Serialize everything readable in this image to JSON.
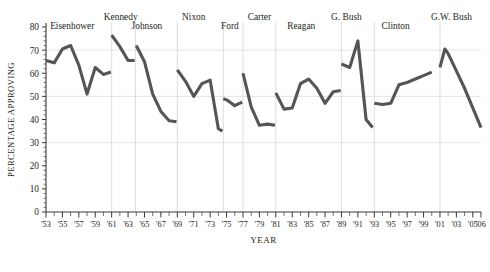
{
  "chart_data": {
    "type": "line",
    "title": "",
    "xlabel": "YEAR",
    "ylabel": "PERCENTAGE APPROVING",
    "ylim": [
      0,
      80
    ],
    "ytick_values": [
      0,
      10,
      20,
      30,
      40,
      50,
      60,
      70,
      80
    ],
    "ytick_labels": [
      "0",
      "10",
      "20",
      "30",
      "40",
      "50",
      "60",
      "70",
      "80"
    ],
    "xlim": [
      1953,
      2006
    ],
    "xtick_labels": [
      "'53",
      "'55",
      "'57",
      "'59",
      "'61",
      "'63",
      "'65",
      "'67",
      "'69",
      "'71",
      "'73",
      "'75",
      "'77",
      "'79",
      "'81",
      "'83",
      "'85",
      "'87",
      "'89",
      "'91",
      "'93",
      "'95",
      "'97",
      "'99",
      "'01",
      "'03",
      "'05",
      "'06"
    ],
    "xtick_years": [
      1953,
      1955,
      1957,
      1959,
      1961,
      1963,
      1965,
      1967,
      1969,
      1971,
      1973,
      1975,
      1977,
      1979,
      1981,
      1983,
      1985,
      1987,
      1989,
      1991,
      1993,
      1995,
      1997,
      1999,
      2001,
      2003,
      2005,
      2006
    ],
    "minor_tick_years": [
      1954,
      1956,
      1958,
      1960,
      1962,
      1964,
      1966,
      1968,
      1970,
      1972,
      1974,
      1976,
      1978,
      1980,
      1982,
      1984,
      1986,
      1988,
      1990,
      1992,
      1994,
      1996,
      1998,
      2000,
      2002,
      2004
    ],
    "grid": "horizontal-at-30-50-70",
    "gridline_values": [
      30,
      50,
      70
    ],
    "legend": "none",
    "line_color": "#555457",
    "annotations": [
      {
        "label": "Eisenhower",
        "x": 1956.2,
        "y_px": 21
      },
      {
        "label": "Kennedy",
        "x": 1962.1,
        "y_px": 12
      },
      {
        "label": "Johnson",
        "x": 1965.3,
        "y_px": 21
      },
      {
        "label": "Nixon",
        "x": 1971.0,
        "y_px": 12
      },
      {
        "label": "Ford",
        "x": 1975.4,
        "y_px": 21
      },
      {
        "label": "Carter",
        "x": 1979.0,
        "y_px": 12
      },
      {
        "label": "Reagan",
        "x": 1984.1,
        "y_px": 21
      },
      {
        "label": "G. Bush",
        "x": 1989.6,
        "y_px": 12
      },
      {
        "label": "Clinton",
        "x": 1995.6,
        "y_px": 21
      },
      {
        "label": "G.W. Bush",
        "x": 2002.4,
        "y_px": 12
      }
    ],
    "term_dividers": [
      1961,
      1963.9,
      1969,
      1974.6,
      1977,
      1981,
      1989,
      1993,
      2001
    ],
    "series": [
      {
        "name": "Eisenhower",
        "points": [
          {
            "year": 1953,
            "value": 65.5
          },
          {
            "year": 1954,
            "value": 64.5
          },
          {
            "year": 1955,
            "value": 70.5
          },
          {
            "year": 1956,
            "value": 72.0
          },
          {
            "year": 1957,
            "value": 63.5
          },
          {
            "year": 1958,
            "value": 51.0
          },
          {
            "year": 1959,
            "value": 62.5
          },
          {
            "year": 1960,
            "value": 59.5
          },
          {
            "year": 1960.9,
            "value": 60.5
          }
        ]
      },
      {
        "name": "Kennedy",
        "points": [
          {
            "year": 1961,
            "value": 76.5
          },
          {
            "year": 1962,
            "value": 71.5
          },
          {
            "year": 1963,
            "value": 65.5
          },
          {
            "year": 1963.8,
            "value": 65.5
          }
        ]
      },
      {
        "name": "Johnson",
        "points": [
          {
            "year": 1964,
            "value": 72.0
          },
          {
            "year": 1965,
            "value": 65.0
          },
          {
            "year": 1966,
            "value": 51.0
          },
          {
            "year": 1967,
            "value": 43.5
          },
          {
            "year": 1968,
            "value": 39.5
          },
          {
            "year": 1968.9,
            "value": 39.0
          }
        ]
      },
      {
        "name": "Nixon",
        "points": [
          {
            "year": 1969,
            "value": 61.5
          },
          {
            "year": 1970,
            "value": 56.5
          },
          {
            "year": 1971,
            "value": 50.0
          },
          {
            "year": 1972,
            "value": 55.5
          },
          {
            "year": 1973,
            "value": 57.0
          },
          {
            "year": 1974,
            "value": 36.0
          },
          {
            "year": 1974.5,
            "value": 35.0
          }
        ]
      },
      {
        "name": "Ford",
        "points": [
          {
            "year": 1974.6,
            "value": 49.0
          },
          {
            "year": 1975,
            "value": 48.5
          },
          {
            "year": 1976,
            "value": 46.0
          },
          {
            "year": 1976.9,
            "value": 47.5
          }
        ]
      },
      {
        "name": "Carter",
        "points": [
          {
            "year": 1977,
            "value": 60.0
          },
          {
            "year": 1978,
            "value": 45.5
          },
          {
            "year": 1979,
            "value": 37.5
          },
          {
            "year": 1980,
            "value": 38.0
          },
          {
            "year": 1980.9,
            "value": 37.5
          }
        ]
      },
      {
        "name": "Reagan",
        "points": [
          {
            "year": 1981,
            "value": 51.5
          },
          {
            "year": 1982,
            "value": 44.5
          },
          {
            "year": 1983,
            "value": 45.0
          },
          {
            "year": 1984,
            "value": 55.5
          },
          {
            "year": 1985,
            "value": 57.5
          },
          {
            "year": 1986,
            "value": 53.5
          },
          {
            "year": 1987,
            "value": 47.0
          },
          {
            "year": 1988,
            "value": 52.0
          },
          {
            "year": 1988.9,
            "value": 52.5
          }
        ]
      },
      {
        "name": "G. Bush",
        "points": [
          {
            "year": 1989,
            "value": 64.0
          },
          {
            "year": 1990,
            "value": 62.5
          },
          {
            "year": 1991,
            "value": 74.0
          },
          {
            "year": 1992,
            "value": 40.0
          },
          {
            "year": 1992.8,
            "value": 36.5
          }
        ]
      },
      {
        "name": "Clinton",
        "points": [
          {
            "year": 1993,
            "value": 47.0
          },
          {
            "year": 1994,
            "value": 46.5
          },
          {
            "year": 1995,
            "value": 47.0
          },
          {
            "year": 1996,
            "value": 55.0
          },
          {
            "year": 1997,
            "value": 56.0
          },
          {
            "year": 1998,
            "value": 57.5
          },
          {
            "year": 1999,
            "value": 59.0
          },
          {
            "year": 2000,
            "value": 60.5
          }
        ]
      },
      {
        "name": "G.W. Bush",
        "points": [
          {
            "year": 2001,
            "value": 62.5
          },
          {
            "year": 2001.6,
            "value": 70.5
          },
          {
            "year": 2002,
            "value": 68.5
          },
          {
            "year": 2003,
            "value": 61.0
          },
          {
            "year": 2004,
            "value": 53.5
          },
          {
            "year": 2005,
            "value": 45.0
          },
          {
            "year": 2006,
            "value": 36.5
          }
        ]
      }
    ]
  }
}
